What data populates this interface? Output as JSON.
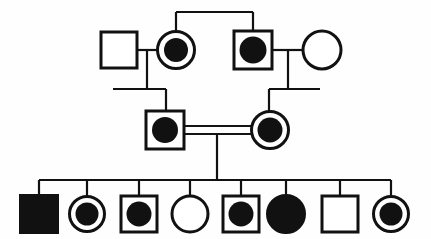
{
  "diagram": {
    "type": "pedigree-chart",
    "title": "",
    "background_color": "#ffffff",
    "line_color": "#111111",
    "fill_color": "#111111",
    "canvas": {
      "width": 431,
      "height": 239
    },
    "symbol_legend": {
      "square": "male",
      "circle": "female",
      "filled": "affected",
      "unfilled": "unaffected",
      "dot-in-symbol": "affected-carrier-marked",
      "double-horizontal-line": "consanguineous-mating"
    },
    "generations": [
      {
        "label": "I",
        "individuals": [
          {
            "id": "I-1",
            "shape": "square",
            "fill": "unfilled",
            "sex": "male",
            "affected": "no",
            "cx": 119,
            "cy": 50,
            "size": 36
          },
          {
            "id": "I-2",
            "shape": "circle",
            "fill": "dot-in-circle",
            "sex": "female",
            "affected": "yes",
            "cx": 176,
            "cy": 50,
            "r": 19
          },
          {
            "id": "I-3",
            "shape": "square",
            "fill": "dot-in-square",
            "sex": "male",
            "affected": "yes",
            "cx": 253,
            "cy": 50,
            "size": 38
          },
          {
            "id": "I-4",
            "shape": "circle",
            "fill": "unfilled",
            "sex": "female",
            "affected": "no",
            "cx": 322,
            "cy": 50,
            "r": 19
          }
        ]
      },
      {
        "label": "II",
        "individuals": [
          {
            "id": "II-1",
            "shape": "square",
            "fill": "dot-in-square",
            "sex": "male",
            "affected": "yes",
            "cx": 165,
            "cy": 130,
            "size": 38
          },
          {
            "id": "II-2",
            "shape": "circle",
            "fill": "dot-in-circle",
            "sex": "female",
            "affected": "yes",
            "cx": 270,
            "cy": 130,
            "r": 19
          }
        ]
      },
      {
        "label": "III",
        "individuals": [
          {
            "id": "III-1",
            "shape": "square",
            "fill": "filled",
            "sex": "male",
            "affected": "yes",
            "cx": 39,
            "cy": 214,
            "size": 38
          },
          {
            "id": "III-2",
            "shape": "circle",
            "fill": "dot-in-circle",
            "sex": "female",
            "affected": "yes",
            "cx": 87,
            "cy": 214,
            "r": 18
          },
          {
            "id": "III-3",
            "shape": "square",
            "fill": "dot-in-square",
            "sex": "male",
            "affected": "yes",
            "cx": 139,
            "cy": 214,
            "size": 36
          },
          {
            "id": "III-4",
            "shape": "circle",
            "fill": "unfilled",
            "sex": "female",
            "affected": "no",
            "cx": 190,
            "cy": 214,
            "r": 18
          },
          {
            "id": "III-5",
            "shape": "square",
            "fill": "dot-in-square",
            "sex": "male",
            "affected": "yes",
            "cx": 241,
            "cy": 214,
            "size": 36
          },
          {
            "id": "III-6",
            "shape": "circle",
            "fill": "filled",
            "sex": "female",
            "affected": "yes",
            "cx": 286,
            "cy": 214,
            "r": 19
          },
          {
            "id": "III-7",
            "shape": "square",
            "fill": "unfilled",
            "sex": "male",
            "affected": "no",
            "cx": 340,
            "cy": 214,
            "size": 36
          },
          {
            "id": "III-8",
            "shape": "circle",
            "fill": "dot-in-circle",
            "sex": "female",
            "affected": "yes",
            "cx": 391,
            "cy": 214,
            "r": 18
          }
        ]
      }
    ],
    "matings": [
      {
        "id": "mating-I-1-x-I-2",
        "partners": [
          "I-1",
          "I-2"
        ],
        "consanguineous": false,
        "y": 50
      },
      {
        "id": "mating-I-3-x-I-4",
        "partners": [
          "I-3",
          "I-4"
        ],
        "consanguineous": false,
        "y": 50
      },
      {
        "id": "mating-II-1-x-II-2",
        "partners": [
          "II-1",
          "II-2"
        ],
        "consanguineous": true,
        "y": 130
      }
    ],
    "sibship_lines": [
      {
        "id": "sibship-top",
        "y": 12,
        "x1": 176,
        "x2": 253,
        "children": [
          "I-2",
          "I-3"
        ]
      },
      {
        "id": "sibship-II-left",
        "y": 89,
        "x1": 113,
        "x2": 166,
        "children": [
          "II-1"
        ]
      },
      {
        "id": "sibship-II-right",
        "y": 89,
        "x1": 269,
        "x2": 320,
        "children": [
          "II-2"
        ]
      },
      {
        "id": "sibship-III",
        "y": 180,
        "x1": 39,
        "x2": 391,
        "children": [
          "III-1",
          "III-2",
          "III-3",
          "III-4",
          "III-5",
          "III-6",
          "III-7",
          "III-8"
        ]
      }
    ],
    "counts": {
      "total_individuals": 14,
      "affected": 10,
      "unaffected": 4,
      "generations": 3,
      "children_bottom_row": 8
    }
  }
}
